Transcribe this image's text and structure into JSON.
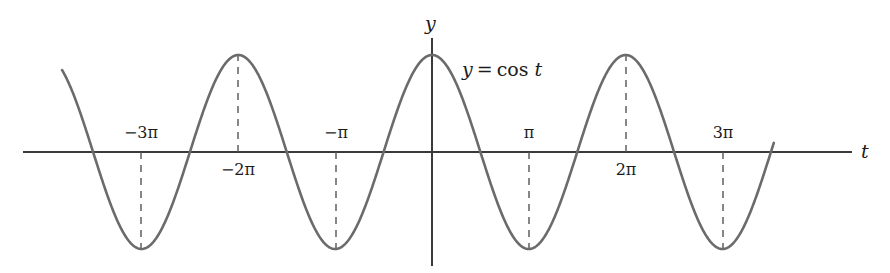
{
  "figure": {
    "width": 890,
    "height": 273,
    "background_color": "#ffffff"
  },
  "axes": {
    "x_axis_name": "t",
    "y_axis_name": "y",
    "axis_color": "#3a3a3a",
    "x_axis_pixel_y": 152,
    "y_axis_pixel_x": 432,
    "x_axis_start_px": 23,
    "x_axis_end_px": 852,
    "y_axis_top_px": 38,
    "y_axis_bottom_px": 266
  },
  "curve": {
    "label_parts": {
      "lhs": "y",
      "eq": "=",
      "fn": "cos",
      "arg": "t"
    },
    "label_text": "y = cos t",
    "color": "#6b6b6b",
    "stroke_width": 2.6,
    "dash_color": "#555555"
  },
  "ticks": [
    {
      "id": "neg-3pi",
      "label": "−3π",
      "t_units": -3,
      "pixel_x": 141,
      "label_side": "above",
      "extremum": "min"
    },
    {
      "id": "neg-2pi",
      "label": "−2π",
      "t_units": -2,
      "pixel_x": 238,
      "label_side": "below",
      "extremum": "max"
    },
    {
      "id": "neg-1pi",
      "label": "−π",
      "t_units": -1,
      "pixel_x": 336,
      "label_side": "above",
      "extremum": "min"
    },
    {
      "id": "pos-1pi",
      "label": "π",
      "t_units": 1,
      "pixel_x": 529,
      "label_side": "above",
      "extremum": "min"
    },
    {
      "id": "pos-2pi",
      "label": "2π",
      "t_units": 2,
      "pixel_x": 626,
      "label_side": "below",
      "extremum": "max"
    },
    {
      "id": "pos-3pi",
      "label": "3π",
      "t_units": 3,
      "pixel_x": 723,
      "label_side": "above",
      "extremum": "min"
    }
  ],
  "chart_data": {
    "type": "line",
    "title": "",
    "subtitle": "",
    "xlabel": "t",
    "ylabel": "y",
    "grid": false,
    "legend": null,
    "annotations": [
      {
        "text": "y = cos t",
        "x_units": 0.45,
        "y_units": 0.85
      }
    ],
    "xlim": [
      -3.82,
      3.53
    ],
    "ylim": [
      -1.18,
      1.18
    ],
    "x_tick_units": [
      -3,
      -2,
      -1,
      1,
      2,
      3
    ],
    "x_tick_labels": [
      "−3π",
      "−2π",
      "−π",
      "π",
      "2π",
      "3π"
    ],
    "x_tick_unit_name": "pi",
    "y_tick_units": [],
    "y_tick_labels": [],
    "series": [
      {
        "name": "y = cos t",
        "formula": "y = cos(t)",
        "color": "#6b6b6b",
        "amplitude": 1,
        "period_units": 2,
        "phase": 0,
        "x_units": [
          -3.82,
          -3.6,
          -3.4,
          -3.2,
          -3.0,
          -2.8,
          -2.6,
          -2.4,
          -2.2,
          -2.0,
          -1.8,
          -1.6,
          -1.4,
          -1.2,
          -1.0,
          -0.8,
          -0.6,
          -0.4,
          -0.2,
          0.0,
          0.2,
          0.4,
          0.6,
          0.8,
          1.0,
          1.2,
          1.4,
          1.6,
          1.8,
          2.0,
          2.2,
          2.4,
          2.6,
          2.8,
          3.0,
          3.2,
          3.4,
          3.53
        ],
        "y_values": [
          0.7705,
          0.809,
          0.309,
          -0.309,
          -1.0,
          -0.309,
          0.309,
          0.809,
          0.951,
          1.0,
          0.951,
          0.809,
          0.309,
          -0.309,
          -1.0,
          -0.309,
          0.309,
          0.809,
          0.951,
          1.0,
          0.951,
          0.809,
          0.309,
          -0.309,
          -1.0,
          -0.309,
          0.309,
          0.809,
          0.951,
          1.0,
          0.951,
          0.809,
          0.309,
          -0.309,
          -1.0,
          -0.309,
          0.309,
          0.6593
        ]
      }
    ],
    "extrema": [
      {
        "t_units": -3,
        "y": -1,
        "kind": "minimum"
      },
      {
        "t_units": -2,
        "y": 1,
        "kind": "maximum"
      },
      {
        "t_units": -1,
        "y": -1,
        "kind": "minimum"
      },
      {
        "t_units": 0,
        "y": 1,
        "kind": "maximum"
      },
      {
        "t_units": 1,
        "y": -1,
        "kind": "minimum"
      },
      {
        "t_units": 2,
        "y": 1,
        "kind": "maximum"
      },
      {
        "t_units": 3,
        "y": -1,
        "kind": "minimum"
      }
    ]
  }
}
